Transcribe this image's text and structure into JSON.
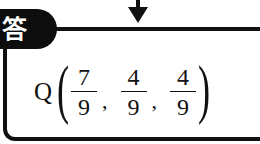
{
  "header": {
    "label": "答",
    "label_bg_color": "#0d0d0d",
    "label_text_color": "#ffffff"
  },
  "arrow": {
    "direction": "down",
    "icon": "down-arrow-icon"
  },
  "answer": {
    "point": "Q",
    "open_paren": "(",
    "close_paren": ")",
    "coordinates": [
      {
        "numerator": "7",
        "denominator": "9"
      },
      {
        "numerator": "4",
        "denominator": "9"
      },
      {
        "numerator": "4",
        "denominator": "9"
      }
    ],
    "separator": ","
  }
}
